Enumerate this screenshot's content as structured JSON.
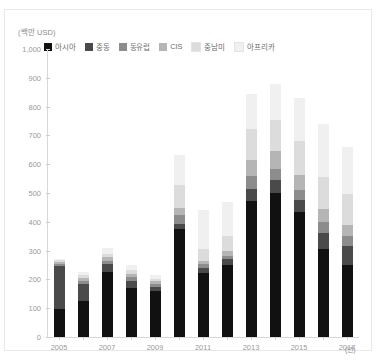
{
  "axes": {
    "y_unit": "(백만 USD)",
    "x_unit": "(년)",
    "y_ticks": [
      "1,000",
      "900",
      "800",
      "700",
      "600",
      "500",
      "400",
      "300",
      "200",
      "100",
      "0"
    ]
  },
  "legend": [
    {
      "label": "아시아",
      "color": "#111111"
    },
    {
      "label": "중동",
      "color": "#4a4a4a"
    },
    {
      "label": "동유럽",
      "color": "#8c8c8c"
    },
    {
      "label": "CIS",
      "color": "#b5b5b5"
    },
    {
      "label": "중남미",
      "color": "#dcdcdc"
    },
    {
      "label": "아프리카",
      "color": "#f0f0f0"
    }
  ],
  "chart_data": {
    "type": "bar",
    "stacked": true,
    "title": "",
    "xlabel": "(년)",
    "ylabel": "(백만 USD)",
    "ylim": [
      0,
      1000
    ],
    "ytick_step": 100,
    "grid": false,
    "legend_position": "top-left",
    "categories": [
      "2005",
      "2006",
      "2007",
      "2008",
      "2009",
      "2010",
      "2011",
      "2012",
      "2013",
      "2014",
      "2015",
      "2016",
      "2017"
    ],
    "tick_labels": [
      "2005",
      "",
      "2007",
      "",
      "2009",
      "",
      "2011",
      "",
      "2013",
      "",
      "2015",
      "",
      "2017"
    ],
    "series": [
      {
        "name": "아시아",
        "color": "#111111",
        "values": [
          97,
          125,
          225,
          170,
          160,
          375,
          222,
          250,
          473,
          500,
          435,
          305,
          250
        ]
      },
      {
        "name": "중동",
        "color": "#4a4a4a",
        "values": [
          148,
          58,
          27,
          25,
          15,
          18,
          18,
          20,
          40,
          45,
          42,
          55,
          65
        ]
      },
      {
        "name": "동유럽",
        "color": "#8c8c8c",
        "values": [
          8,
          12,
          13,
          12,
          10,
          30,
          12,
          12,
          45,
          40,
          35,
          40,
          35
        ]
      },
      {
        "name": "CIS",
        "color": "#b5b5b5",
        "values": [
          7,
          10,
          12,
          12,
          8,
          25,
          12,
          15,
          55,
          60,
          50,
          45,
          40
        ]
      },
      {
        "name": "중남미",
        "color": "#dcdcdc",
        "values": [
          6,
          10,
          13,
          13,
          10,
          80,
          42,
          55,
          110,
          110,
          118,
          110,
          105
        ]
      },
      {
        "name": "아프리카",
        "color": "#f0f0f0",
        "values": [
          4,
          10,
          20,
          18,
          12,
          105,
          134,
          118,
          122,
          125,
          150,
          185,
          165
        ]
      }
    ],
    "totals": [
      270,
      225,
      310,
      250,
      215,
      633,
      440,
      470,
      845,
      880,
      830,
      740,
      660
    ]
  }
}
